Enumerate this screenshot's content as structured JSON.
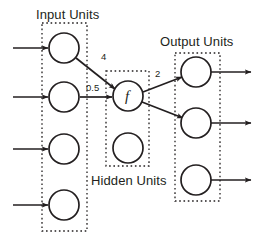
{
  "diagram": {
    "groups": [
      {
        "id": "input",
        "label": "Input Units",
        "box": {
          "x": 42,
          "y": 23,
          "w": 45,
          "h": 208
        },
        "unit_count": 4
      },
      {
        "id": "hidden",
        "label": "Hidden Units",
        "box": {
          "x": 106,
          "y": 71,
          "w": 43,
          "h": 95
        },
        "unit_count": 2
      },
      {
        "id": "output",
        "label": "Output Units",
        "box": {
          "x": 175,
          "y": 53,
          "w": 45,
          "h": 148
        },
        "unit_count": 3
      }
    ],
    "units": [
      {
        "id": "input-unit-1",
        "group": "input",
        "cx": 64,
        "cy": 48,
        "r": 15,
        "text": ""
      },
      {
        "id": "input-unit-2",
        "group": "input",
        "cx": 64,
        "cy": 97,
        "r": 15,
        "text": ""
      },
      {
        "id": "input-unit-3",
        "group": "input",
        "cx": 64,
        "cy": 149,
        "r": 15,
        "text": ""
      },
      {
        "id": "input-unit-4",
        "group": "input",
        "cx": 64,
        "cy": 205,
        "r": 15,
        "text": ""
      },
      {
        "id": "hidden-unit-1",
        "group": "hidden",
        "cx": 128,
        "cy": 96,
        "r": 15,
        "text": "f"
      },
      {
        "id": "hidden-unit-2",
        "group": "hidden",
        "cx": 128,
        "cy": 148,
        "r": 15,
        "text": ""
      },
      {
        "id": "output-unit-1",
        "group": "output",
        "cx": 196,
        "cy": 72,
        "r": 15,
        "text": ""
      },
      {
        "id": "output-unit-2",
        "group": "output",
        "cx": 196,
        "cy": 123,
        "r": 15,
        "text": ""
      },
      {
        "id": "output-unit-3",
        "group": "output",
        "cx": 196,
        "cy": 180,
        "r": 15,
        "text": ""
      }
    ],
    "external_input_arrows": [
      {
        "id": "external-input-arrow-1",
        "x1": 13,
        "y1": 48,
        "x2": 48,
        "y2": 48
      },
      {
        "id": "external-input-arrow-2",
        "x1": 13,
        "y1": 97,
        "x2": 48,
        "y2": 97
      },
      {
        "id": "external-input-arrow-3",
        "x1": 13,
        "y1": 149,
        "x2": 48,
        "y2": 149
      },
      {
        "id": "external-input-arrow-4",
        "x1": 13,
        "y1": 205,
        "x2": 48,
        "y2": 205
      }
    ],
    "external_output_arrows": [
      {
        "id": "external-output-arrow-1",
        "x1": 211,
        "y1": 72,
        "x2": 251,
        "y2": 72
      },
      {
        "id": "external-output-arrow-2",
        "x1": 211,
        "y1": 123,
        "x2": 251,
        "y2": 123
      },
      {
        "id": "external-output-arrow-3",
        "x1": 211,
        "y1": 180,
        "x2": 251,
        "y2": 180
      }
    ],
    "connections": [
      {
        "id": "connection-input1-hidden1",
        "from": "input-unit-1",
        "to": "hidden-unit-1",
        "weight": "4",
        "x1": 76,
        "y1": 58,
        "x2": 115,
        "y2": 89
      },
      {
        "id": "connection-input2-hidden1",
        "from": "input-unit-2",
        "to": "hidden-unit-1",
        "weight": "0.5",
        "x1": 80,
        "y1": 97,
        "x2": 112,
        "y2": 97
      },
      {
        "id": "connection-hidden1-output1",
        "from": "hidden-unit-1",
        "to": "output-unit-1",
        "weight": "2",
        "x1": 143,
        "y1": 92,
        "x2": 182,
        "y2": 77
      },
      {
        "id": "connection-hidden1-output2",
        "from": "hidden-unit-1",
        "to": "output-unit-2",
        "weight": "",
        "x1": 142,
        "y1": 102,
        "x2": 183,
        "y2": 118
      }
    ],
    "colors": {
      "stroke": "#231f20",
      "text": "#231f20",
      "background": "#ffffff",
      "dotted_box": "#231f20"
    }
  }
}
